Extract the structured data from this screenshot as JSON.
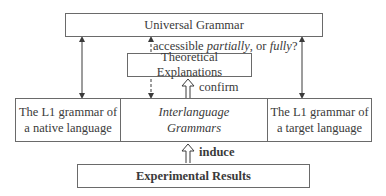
{
  "diagram": {
    "universal_grammar": "Universal Grammar",
    "accessibility_question": {
      "prefix": "accessible ",
      "partially": "partially",
      "middle": ", or ",
      "fully": "fully",
      "suffix": "?"
    },
    "theoretical_explanations": "Theoretical Explanations",
    "confirm_label": "confirm",
    "grammars_row": {
      "left": [
        "The L1 grammar of",
        "a native language"
      ],
      "center": [
        "Interlanguage",
        "Grammars"
      ],
      "right": [
        "The L1 grammar of",
        "a target language"
      ]
    },
    "induce_label": "induce",
    "experimental_results": "Experimental Results",
    "colors": {
      "line": "#3a3a3a",
      "border": "#6a6a6a",
      "text": "#3a3a3a"
    }
  }
}
